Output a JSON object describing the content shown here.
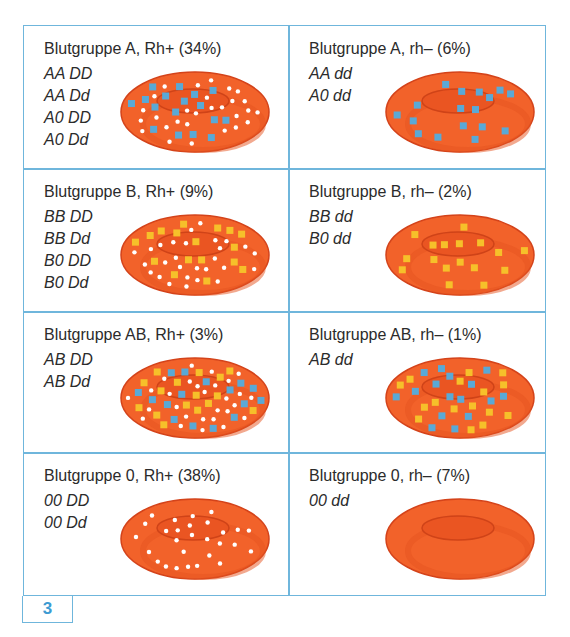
{
  "figure_number": "3",
  "colors": {
    "border": "#6fb6dc",
    "cell_fill": "#f2622a",
    "cell_edge": "#d4431a",
    "antigen_A": "#5aa9d6",
    "antigen_B": "#f6c02a",
    "antigen_D": "#ffffff"
  },
  "legend_semantics": {
    "blue_square": "Antigen A",
    "yellow_square": "Antigen B",
    "white_dot": "Rhesus-Antigen D"
  },
  "cells": [
    {
      "title": "Blutgruppe A, Rh+ (34%)",
      "genotypes": [
        "AA DD",
        "AA Dd",
        "A0 DD",
        "A0 Dd"
      ],
      "antigens": {
        "A": true,
        "B": false,
        "D": true
      }
    },
    {
      "title": "Blutgruppe A, rh– (6%)",
      "genotypes": [
        "AA dd",
        "A0 dd"
      ],
      "antigens": {
        "A": true,
        "B": false,
        "D": false
      }
    },
    {
      "title": "Blutgruppe B, Rh+ (9%)",
      "genotypes": [
        "BB DD",
        "BB Dd",
        "B0 DD",
        "B0 Dd"
      ],
      "antigens": {
        "A": false,
        "B": true,
        "D": true
      }
    },
    {
      "title": "Blutgruppe B, rh– (2%)",
      "genotypes": [
        "BB dd",
        "B0 dd"
      ],
      "antigens": {
        "A": false,
        "B": true,
        "D": false
      }
    },
    {
      "title": "Blutgruppe AB, Rh+ (3%)",
      "genotypes": [
        "AB DD",
        "AB Dd"
      ],
      "antigens": {
        "A": true,
        "B": true,
        "D": true
      }
    },
    {
      "title": "Blutgruppe AB, rh– (1%)",
      "genotypes": [
        "AB dd"
      ],
      "antigens": {
        "A": true,
        "B": true,
        "D": false
      }
    },
    {
      "title": "Blutgruppe 0, Rh+ (38%)",
      "genotypes": [
        "00 DD",
        "00 Dd"
      ],
      "antigens": {
        "A": false,
        "B": false,
        "D": true
      }
    },
    {
      "title": "Blutgruppe 0, rh– (7%)",
      "genotypes": [
        "00 dd"
      ],
      "antigens": {
        "A": false,
        "B": false,
        "D": false
      }
    }
  ]
}
